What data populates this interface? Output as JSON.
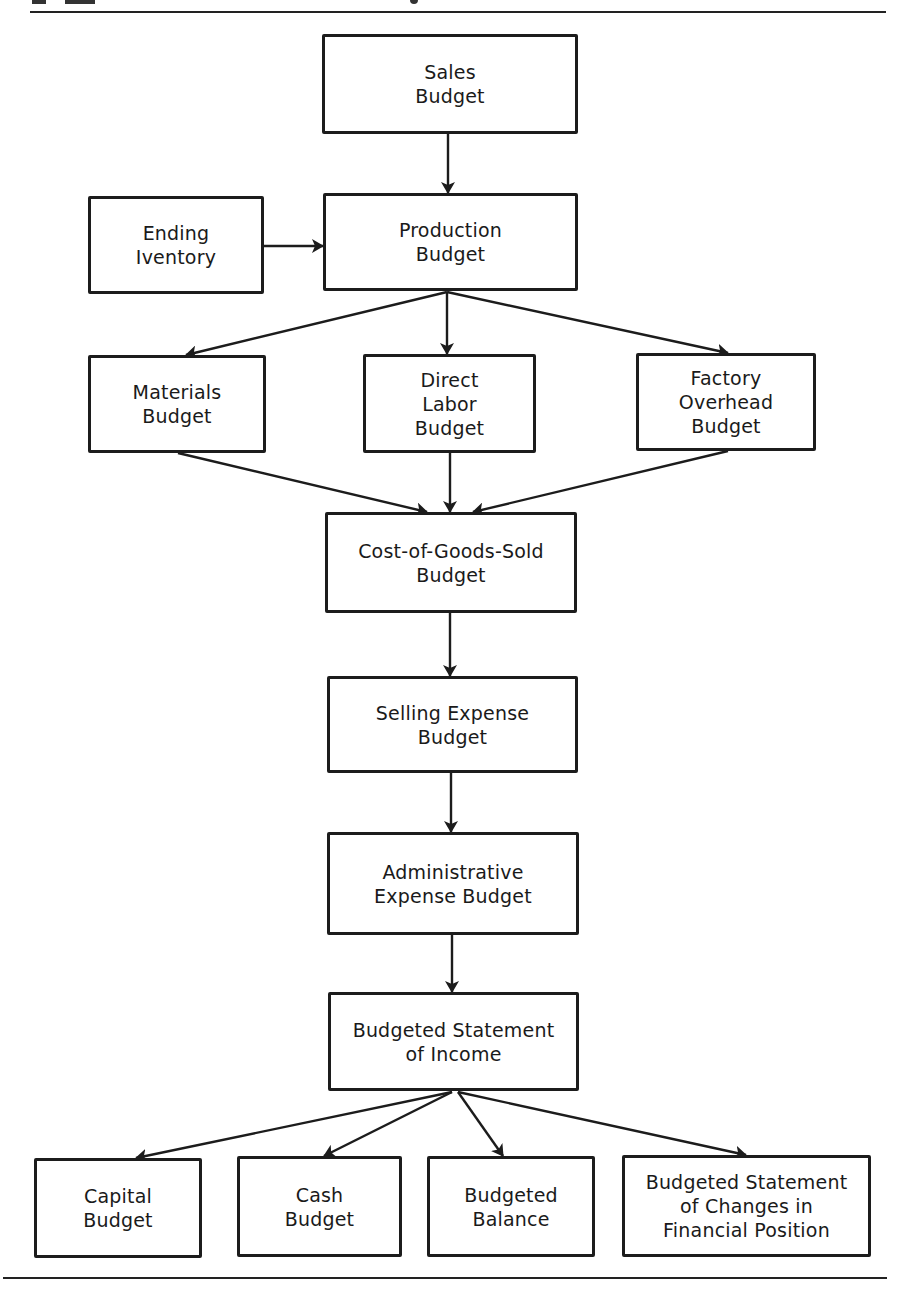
{
  "diagram": {
    "colors": {
      "line": "#1c1c1c",
      "background": "#ffffff",
      "box_fill": "#ffffff"
    },
    "nodes": [
      {
        "id": "sales",
        "lines": [
          "Sales",
          "Budget"
        ],
        "x": 322,
        "y": 34,
        "w": 256,
        "h": 100
      },
      {
        "id": "ending_inventory",
        "lines": [
          "Ending",
          "Iventory"
        ],
        "x": 88,
        "y": 196,
        "w": 176,
        "h": 98
      },
      {
        "id": "production",
        "lines": [
          "Production",
          "Budget"
        ],
        "x": 323,
        "y": 193,
        "w": 255,
        "h": 98
      },
      {
        "id": "materials",
        "lines": [
          "Materials",
          "Budget"
        ],
        "x": 88,
        "y": 355,
        "w": 178,
        "h": 98
      },
      {
        "id": "direct_labor",
        "lines": [
          "Direct",
          "Labor",
          "Budget"
        ],
        "x": 363,
        "y": 354,
        "w": 173,
        "h": 99
      },
      {
        "id": "factory_overhead",
        "lines": [
          "Factory",
          "Overhead",
          "Budget"
        ],
        "x": 636,
        "y": 353,
        "w": 180,
        "h": 98
      },
      {
        "id": "cogs",
        "lines": [
          "Cost-of-Goods-Sold",
          "Budget"
        ],
        "x": 325,
        "y": 512,
        "w": 252,
        "h": 101
      },
      {
        "id": "selling_expense",
        "lines": [
          "Selling Expense",
          "Budget"
        ],
        "x": 327,
        "y": 676,
        "w": 251,
        "h": 97
      },
      {
        "id": "admin_expense",
        "lines": [
          "Administrative",
          "Expense Budget"
        ],
        "x": 327,
        "y": 832,
        "w": 252,
        "h": 103
      },
      {
        "id": "income_statement",
        "lines": [
          "Budgeted Statement",
          "of Income"
        ],
        "x": 328,
        "y": 992,
        "w": 251,
        "h": 99
      },
      {
        "id": "capital",
        "lines": [
          "Capital",
          "Budget"
        ],
        "x": 34,
        "y": 1158,
        "w": 168,
        "h": 100
      },
      {
        "id": "cash",
        "lines": [
          "Cash",
          "Budget"
        ],
        "x": 237,
        "y": 1156,
        "w": 165,
        "h": 101
      },
      {
        "id": "balance",
        "lines": [
          "Budgeted",
          "Balance"
        ],
        "x": 427,
        "y": 1156,
        "w": 168,
        "h": 101
      },
      {
        "id": "changes_fin_pos",
        "lines": [
          "Budgeted Statement",
          "of Changes in",
          "Financial Position"
        ],
        "x": 622,
        "y": 1155,
        "w": 249,
        "h": 102
      }
    ],
    "edges": [
      {
        "from": "sales",
        "to": "production",
        "x1": 448,
        "y1": 134,
        "x2": 448,
        "y2": 193
      },
      {
        "from": "ending_inventory",
        "to": "production",
        "x1": 264,
        "y1": 246,
        "x2": 323,
        "y2": 246
      },
      {
        "from": "production",
        "to": "materials",
        "x1": 447,
        "y1": 292,
        "x2": 186,
        "y2": 355
      },
      {
        "from": "production",
        "to": "direct_labor",
        "x1": 447,
        "y1": 292,
        "x2": 447,
        "y2": 354
      },
      {
        "from": "production",
        "to": "factory_overhead",
        "x1": 447,
        "y1": 292,
        "x2": 728,
        "y2": 353
      },
      {
        "from": "materials",
        "to": "cogs",
        "x1": 178,
        "y1": 453,
        "x2": 427,
        "y2": 512
      },
      {
        "from": "direct_labor",
        "to": "cogs",
        "x1": 450,
        "y1": 453,
        "x2": 450,
        "y2": 512
      },
      {
        "from": "factory_overhead",
        "to": "cogs",
        "x1": 728,
        "y1": 451,
        "x2": 473,
        "y2": 512
      },
      {
        "from": "cogs",
        "to": "selling_expense",
        "x1": 450,
        "y1": 613,
        "x2": 450,
        "y2": 676
      },
      {
        "from": "selling_expense",
        "to": "admin_expense",
        "x1": 451,
        "y1": 773,
        "x2": 451,
        "y2": 832
      },
      {
        "from": "admin_expense",
        "to": "income_statement",
        "x1": 452,
        "y1": 935,
        "x2": 452,
        "y2": 992
      },
      {
        "from": "income_statement",
        "to": "capital",
        "x1": 452,
        "y1": 1092,
        "x2": 136,
        "y2": 1158
      },
      {
        "from": "income_statement",
        "to": "cash",
        "x1": 452,
        "y1": 1092,
        "x2": 324,
        "y2": 1156
      },
      {
        "from": "income_statement",
        "to": "balance",
        "x1": 458,
        "y1": 1092,
        "x2": 503,
        "y2": 1156
      },
      {
        "from": "income_statement",
        "to": "changes_fin_pos",
        "x1": 458,
        "y1": 1092,
        "x2": 746,
        "y2": 1155
      }
    ],
    "rules": [
      {
        "position": "top",
        "x": 30,
        "y": 11,
        "w": 856
      },
      {
        "position": "bottom",
        "x": 3,
        "y": 1277,
        "w": 884
      }
    ]
  }
}
